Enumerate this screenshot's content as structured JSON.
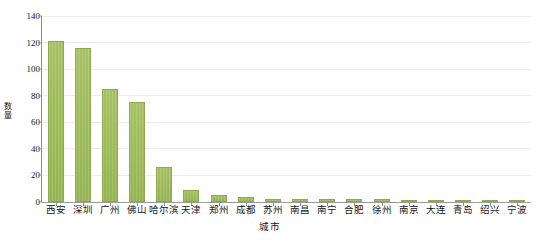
{
  "chart_data": {
    "type": "bar",
    "title": "",
    "xlabel": "城市",
    "ylabel": "数量",
    "categories": [
      "西安",
      "深圳",
      "广州",
      "佛山",
      "哈尔滨",
      "天津",
      "郑州",
      "成都",
      "苏州",
      "南昌",
      "南宁",
      "合肥",
      "徐州",
      "南京",
      "大连",
      "青岛",
      "绍兴",
      "宁波"
    ],
    "values": [
      121,
      116,
      85,
      75,
      26,
      9,
      5,
      4,
      2,
      2,
      2,
      2,
      2,
      1,
      1,
      1,
      1,
      1
    ],
    "ylim": [
      0,
      140
    ],
    "yticks": [
      0,
      20,
      40,
      60,
      80,
      100,
      120,
      140
    ],
    "ytick_labels": [
      "0",
      "20",
      "40",
      "60",
      "80",
      "100",
      "120",
      "140"
    ],
    "grid": "horizontal",
    "legend": "none",
    "bar_color": "#9cba57",
    "bar_edge_color": "#8faa4e",
    "gridline_color": "#eceded",
    "axis_color": "#8d8d8d"
  }
}
